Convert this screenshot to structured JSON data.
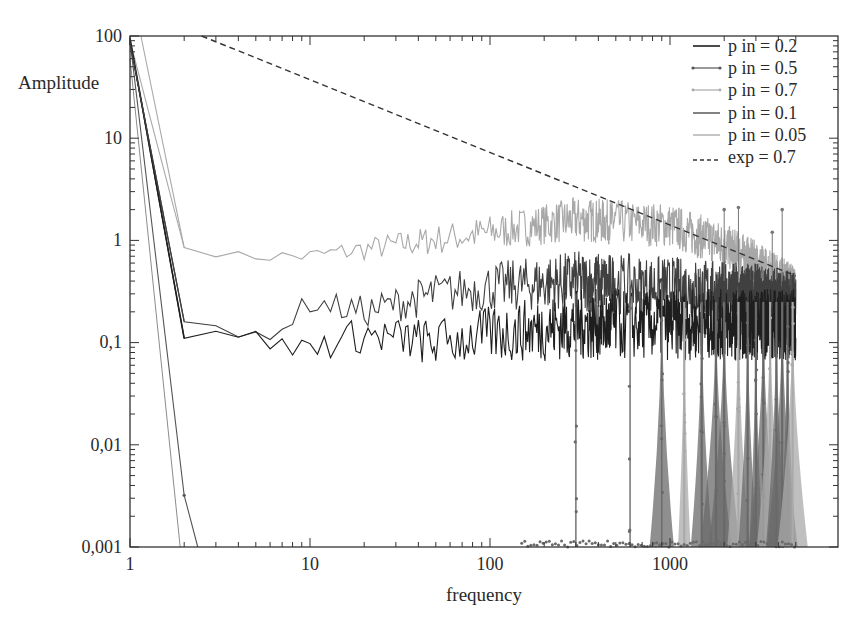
{
  "chart_data": {
    "type": "line",
    "title": "",
    "xlabel": "frequency",
    "ylabel": "Amplitude",
    "xscale": "log",
    "yscale": "log",
    "xlim": [
      1,
      5000
    ],
    "ylim": [
      0.001,
      100
    ],
    "grid": false,
    "legend_position": "upper right",
    "x_ticks": [
      {
        "value": 1,
        "label": "1"
      },
      {
        "value": 10,
        "label": "10"
      },
      {
        "value": 100,
        "label": "100"
      },
      {
        "value": 1000,
        "label": "1000"
      }
    ],
    "y_ticks": [
      {
        "value": 100,
        "label": "100"
      },
      {
        "value": 10,
        "label": "10"
      },
      {
        "value": 1,
        "label": "1"
      },
      {
        "value": 0.1,
        "label": "0,1"
      },
      {
        "value": 0.01,
        "label": "0,01"
      },
      {
        "value": 0.001,
        "label": "0,001"
      }
    ],
    "series": [
      {
        "name": "p in = 0.2",
        "color": "#1e1e1e",
        "style": "solid",
        "marker": "none",
        "x": [
          1,
          2,
          3,
          4,
          5,
          7,
          10,
          20,
          50,
          100,
          300,
          1000,
          3000,
          5000
        ],
        "y": [
          90,
          0.11,
          0.14,
          0.13,
          0.11,
          0.09,
          0.09,
          0.12,
          0.1,
          0.12,
          0.15,
          0.15,
          0.15,
          0.15
        ]
      },
      {
        "name": "p in = 0.5",
        "color": "#555555",
        "style": "solid",
        "marker": "dot",
        "x": [
          1,
          2,
          4,
          10,
          20,
          50,
          100,
          200,
          300,
          600,
          1000,
          2000,
          5000
        ],
        "y": [
          90,
          0.0032,
          0.0009,
          0.001,
          0.001,
          0.001,
          0.001,
          0.001,
          0.001,
          0.001,
          0.001,
          0.001,
          0.001
        ],
        "note": "floor near 0.001 with spikes up to ~0.3 at f≈300, 600, 900, 1200, 1800 and dense spikes beyond 2000"
      },
      {
        "name": "p in = 0.7",
        "color": "#a8a8a8",
        "style": "solid",
        "marker": "dot",
        "x": [
          1,
          2,
          4,
          10,
          30,
          100,
          300,
          1000,
          2000,
          3000,
          5000
        ],
        "y": [
          90,
          0.85,
          0.7,
          0.7,
          0.9,
          1.2,
          1.6,
          1.4,
          0.9,
          0.6,
          0.35
        ]
      },
      {
        "name": "p in = 0.1",
        "color": "#404040",
        "style": "solid",
        "marker": "none",
        "x": [
          1,
          2,
          4,
          7,
          10,
          20,
          50,
          100,
          300,
          1000,
          3000,
          5000
        ],
        "y": [
          85,
          0.16,
          0.11,
          0.14,
          0.25,
          0.2,
          0.3,
          0.35,
          0.4,
          0.35,
          0.3,
          0.25
        ]
      },
      {
        "name": "p in = 0.05",
        "color": "#8c8c8c",
        "style": "solid",
        "marker": "none",
        "x": [
          1,
          1.9
        ],
        "y": [
          60,
          0.001
        ]
      },
      {
        "name": "exp = 0.7",
        "color": "#333333",
        "style": "dashed",
        "marker": "none",
        "x": [
          2.5,
          5000
        ],
        "y": [
          100,
          0.45
        ]
      }
    ]
  },
  "legend": {
    "items": [
      {
        "label": "p in = 0.2"
      },
      {
        "label": "p in = 0.5"
      },
      {
        "label": "p in = 0.7"
      },
      {
        "label": "p in = 0.1"
      },
      {
        "label": "p in = 0.05"
      },
      {
        "label": "exp = 0.7"
      }
    ]
  },
  "axes": {
    "xlabel": "frequency",
    "ylabel": "Amplitude",
    "x_tick_labels": [
      "1",
      "10",
      "100",
      "1000"
    ],
    "y_tick_labels": [
      "100",
      "10",
      "1",
      "0,1",
      "0,01",
      "0,001"
    ]
  }
}
